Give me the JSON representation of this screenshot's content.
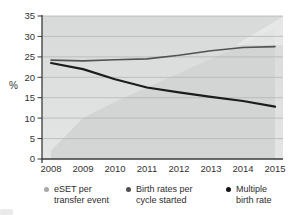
{
  "chart_data": {
    "type": "area",
    "title": "",
    "x": [
      2008,
      2009,
      2010,
      2011,
      2012,
      2013,
      2014,
      2015
    ],
    "series": [
      {
        "name": "eSET per transfer event",
        "type": "area",
        "values": [
          2,
          10,
          14,
          17.5,
          21,
          24.5,
          28,
          32
        ],
        "color": "#bcbdbd",
        "fill": "#d2d3d3"
      },
      {
        "name": "Birth rates per cycle started",
        "type": "line",
        "values": [
          24.2,
          24.0,
          24.3,
          24.5,
          25.4,
          26.5,
          27.3,
          27.5
        ],
        "color": "#525252"
      },
      {
        "name": "Multiple birth rate",
        "type": "line",
        "values": [
          23.5,
          22.0,
          19.5,
          17.5,
          16.3,
          15.2,
          14.2,
          12.8
        ],
        "color": "#1c1c1c"
      }
    ],
    "xlabel": "",
    "ylabel": "%",
    "ylim": [
      0,
      35
    ],
    "yticks": [
      0,
      5,
      10,
      15,
      20,
      25,
      30,
      35
    ],
    "grid": true,
    "legend_position": "bottom"
  },
  "legend": {
    "items": [
      {
        "line1": "eSET per",
        "line2": "transfer event",
        "marker_color": "#a7a8a8"
      },
      {
        "line1": "Birth rates per",
        "line2": "cycle started",
        "marker_color": "#4f4f4f"
      },
      {
        "line1": "Multiple",
        "line2": "birth rate",
        "marker_color": "#141414"
      }
    ]
  },
  "colors": {
    "plot_bg_top": "#d8d9d9",
    "plot_bg_bottom": "#e4e5e5",
    "gridline": "#b4b5b5",
    "axis": "#3a3a3a",
    "tick_text": "#333333",
    "legend_text": "#2d2d2d"
  }
}
